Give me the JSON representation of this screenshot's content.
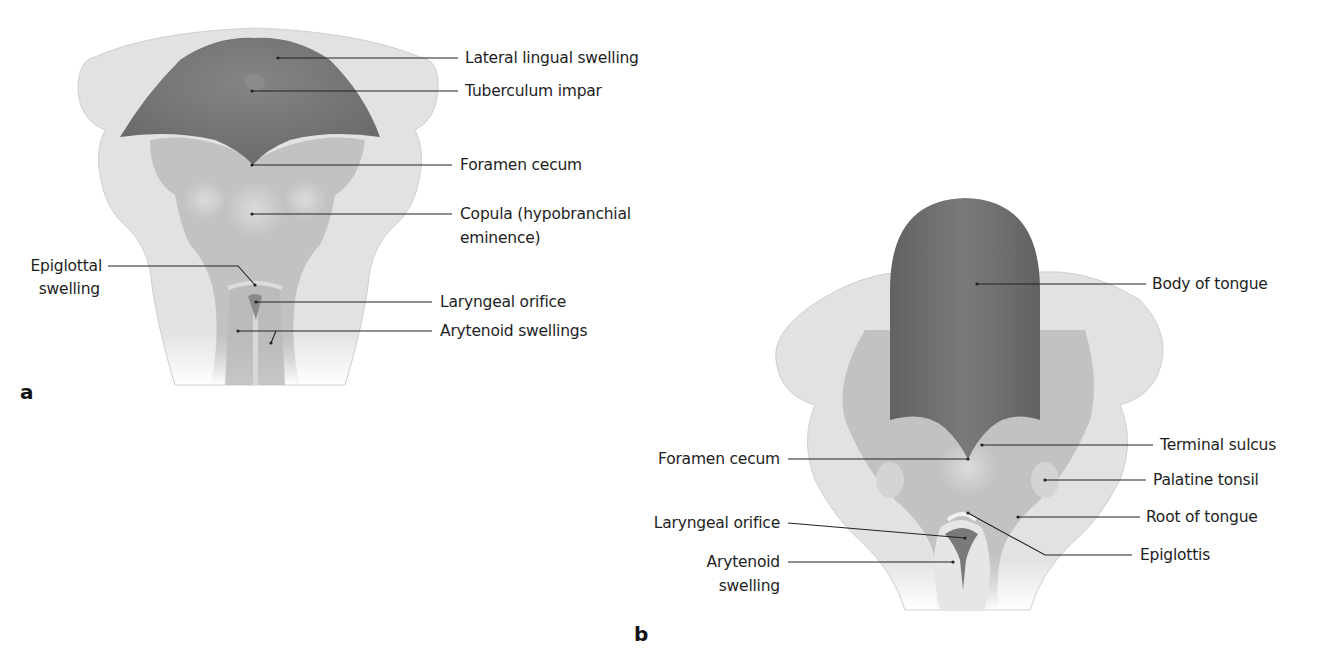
{
  "figure": {
    "panels": [
      {
        "id": "a",
        "letter": "a",
        "labels": {
          "lateral_lingual_swelling": "Lateral lingual swelling",
          "tuberculum_impar": "Tuberculum impar",
          "foramen_cecum": "Foramen cecum",
          "copula_line1": "Copula (hypobranchial",
          "copula_line2": "eminence)",
          "epiglottal_line1": "Epiglottal",
          "epiglottal_line2": "swelling",
          "laryngeal_orifice": "Laryngeal orifice",
          "arytenoid_swellings": "Arytenoid swellings"
        }
      },
      {
        "id": "b",
        "letter": "b",
        "labels": {
          "body_of_tongue": "Body of tongue",
          "terminal_sulcus": "Terminal sulcus",
          "foramen_cecum": "Foramen cecum",
          "palatine_tonsil": "Palatine tonsil",
          "root_of_tongue": "Root of tongue",
          "laryngeal_orifice": "Laryngeal orifice",
          "epiglottis": "Epiglottis",
          "arytenoid_line1": "Arytenoid",
          "arytenoid_line2": "swelling"
        }
      }
    ],
    "colors": {
      "background": "#ffffff",
      "outer_tissue": "#e4e4e4",
      "mid_tissue": "#c4c4c4",
      "tongue_dark": "#6e6e6e",
      "leader_line": "#222222",
      "text": "#1e1e1e"
    }
  }
}
